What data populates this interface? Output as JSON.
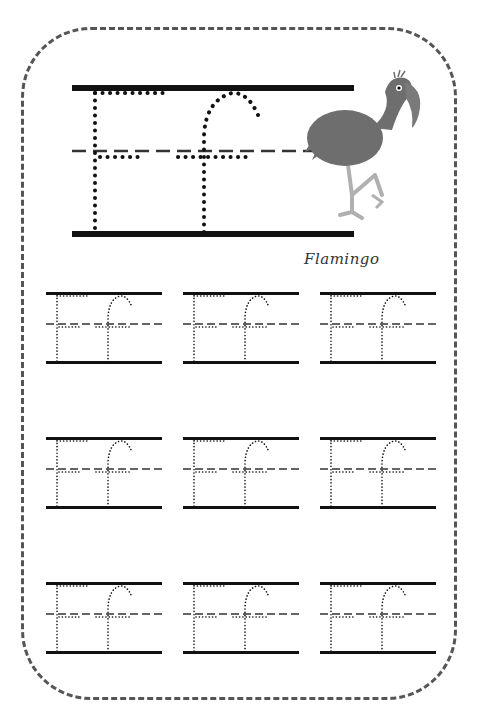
{
  "worksheet": {
    "letter_upper": "E",
    "letter_lower": "f",
    "caption": "Flamingo",
    "illustration": "flamingo",
    "practice_grid": {
      "rows": 3,
      "columns": 3
    }
  },
  "colors": {
    "border": "#555555",
    "line": "#111111",
    "dashline": "#333333",
    "flamingo_body": "#6e6e6e",
    "flamingo_legs": "#b0b0b0"
  }
}
